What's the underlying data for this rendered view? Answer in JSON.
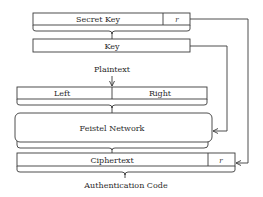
{
  "diagram": {
    "secret_key": {
      "label": "Secret Key",
      "r_label": "r"
    },
    "key": {
      "label": "Key"
    },
    "plaintext": {
      "label": "Plaintext"
    },
    "split": {
      "left": "Left",
      "right": "Right"
    },
    "feistel": {
      "label": "Feistel Network"
    },
    "ciphertext": {
      "label": "Ciphertext",
      "r_label": "r"
    },
    "output": {
      "label": "Authentication Code"
    },
    "colors": {
      "stroke": "#3a3a3a",
      "text": "#2a2a2a",
      "background": "#ffffff"
    }
  }
}
